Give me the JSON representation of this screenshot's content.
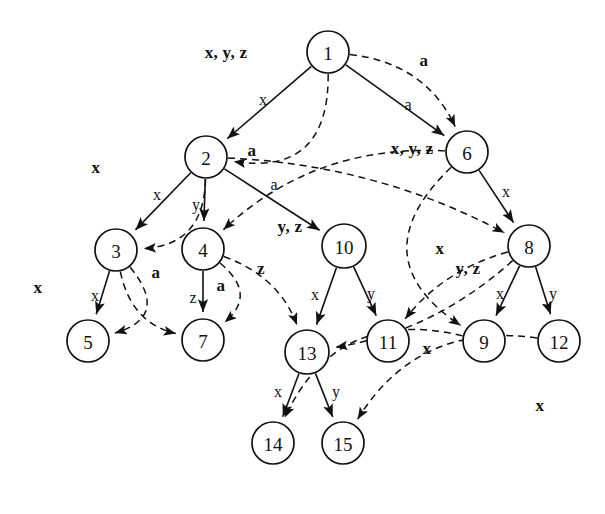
{
  "figure": {
    "type": "directed-graph",
    "title": "",
    "background": "#ffffff",
    "ink": "#111111",
    "solid_edge_style": "solid arrow",
    "dashed_edge_style": "dashed arrow"
  },
  "nodes": [
    {
      "id": "1",
      "label": "1",
      "cx": 328,
      "cy": 52,
      "r": 21
    },
    {
      "id": "2",
      "label": "2",
      "cx": 206,
      "cy": 157,
      "r": 21
    },
    {
      "id": "3",
      "label": "3",
      "cx": 116,
      "cy": 250,
      "r": 21
    },
    {
      "id": "4",
      "label": "4",
      "cx": 203,
      "cy": 249,
      "r": 21
    },
    {
      "id": "5",
      "label": "5",
      "cx": 88,
      "cy": 341,
      "r": 21
    },
    {
      "id": "6",
      "label": "6",
      "cx": 467,
      "cy": 152,
      "r": 21
    },
    {
      "id": "7",
      "label": "7",
      "cx": 203,
      "cy": 340,
      "r": 21
    },
    {
      "id": "8",
      "label": "8",
      "cx": 529,
      "cy": 246,
      "r": 21
    },
    {
      "id": "9",
      "label": "9",
      "cx": 484,
      "cy": 341,
      "r": 21
    },
    {
      "id": "10",
      "label": "10",
      "cx": 344,
      "cy": 246,
      "r": 22
    },
    {
      "id": "11",
      "label": "11",
      "cx": 388,
      "cy": 341,
      "r": 21
    },
    {
      "id": "12",
      "label": "12",
      "cx": 559,
      "cy": 341,
      "r": 21
    },
    {
      "id": "13",
      "label": "13",
      "cx": 307,
      "cy": 352,
      "r": 22
    },
    {
      "id": "14",
      "label": "14",
      "cx": 273,
      "cy": 443,
      "r": 21
    },
    {
      "id": "15",
      "label": "15",
      "cx": 343,
      "cy": 443,
      "r": 21
    }
  ],
  "solid_edges": [
    {
      "from": "1",
      "to": "2",
      "label": "x",
      "lx": 263,
      "ly": 100
    },
    {
      "from": "1",
      "to": "6",
      "label": "a",
      "lx": 408,
      "ly": 105
    },
    {
      "from": "2",
      "to": "3",
      "label": "x",
      "lx": 157,
      "ly": 195
    },
    {
      "from": "2",
      "to": "4",
      "label": "y",
      "lx": 196,
      "ly": 205
    },
    {
      "from": "2",
      "to": "10",
      "label": "a",
      "lx": 274,
      "ly": 185
    },
    {
      "from": "3",
      "to": "5",
      "label": "x",
      "lx": 95,
      "ly": 296
    },
    {
      "from": "4",
      "to": "7",
      "label": "z",
      "lx": 193,
      "ly": 298
    },
    {
      "from": "6",
      "to": "8",
      "label": "x",
      "lx": 506,
      "ly": 192
    },
    {
      "from": "8",
      "to": "9",
      "label": "x",
      "lx": 500,
      "ly": 294
    },
    {
      "from": "8",
      "to": "12",
      "label": "y",
      "lx": 553,
      "ly": 294
    },
    {
      "from": "10",
      "to": "13",
      "label": "x",
      "lx": 315,
      "ly": 295
    },
    {
      "from": "10",
      "to": "11",
      "label": "y",
      "lx": 371,
      "ly": 294
    },
    {
      "from": "13",
      "to": "14",
      "label": "x",
      "lx": 278,
      "ly": 392
    },
    {
      "from": "13",
      "to": "15",
      "label": "y",
      "lx": 336,
      "ly": 392
    }
  ],
  "dashed_edges": [
    {
      "from": "1",
      "to": "2",
      "label": "x, y, z",
      "lx": 226,
      "ly": 52
    },
    {
      "from": "1",
      "to": "6",
      "label": "a",
      "lx": 424,
      "ly": 60
    },
    {
      "from": "2",
      "to": "3",
      "label": "x",
      "lx": 96,
      "ly": 167
    },
    {
      "from": "2",
      "to": "8",
      "label": "a",
      "lx": 252,
      "ly": 150
    },
    {
      "from": "6",
      "to": "4",
      "label": "x, y, z",
      "lx": 412,
      "ly": 148
    },
    {
      "from": "6",
      "to": "9",
      "label": "y, z",
      "lx": 290,
      "ly": 226
    },
    {
      "from": "3",
      "to": "5",
      "label": "x",
      "lx": 38,
      "ly": 287
    },
    {
      "from": "3",
      "to": "7",
      "label": "a",
      "lx": 156,
      "ly": 272
    },
    {
      "from": "4",
      "to": "7",
      "label": "a",
      "lx": 221,
      "ly": 285
    },
    {
      "from": "4",
      "to": "13",
      "label": "z",
      "lx": 261,
      "ly": 268
    },
    {
      "from": "8",
      "to": "13",
      "label": "x",
      "lx": 440,
      "ly": 248
    },
    {
      "from": "8",
      "to": "11",
      "label": "y, z",
      "lx": 468,
      "ly": 268
    },
    {
      "from": "9",
      "to": "14",
      "label": "x",
      "lx": 427,
      "ly": 348
    },
    {
      "from": "12",
      "to": "15",
      "label": "x",
      "lx": 540,
      "ly": 405
    }
  ],
  "alphabet": [
    "x",
    "y",
    "z",
    "a"
  ]
}
